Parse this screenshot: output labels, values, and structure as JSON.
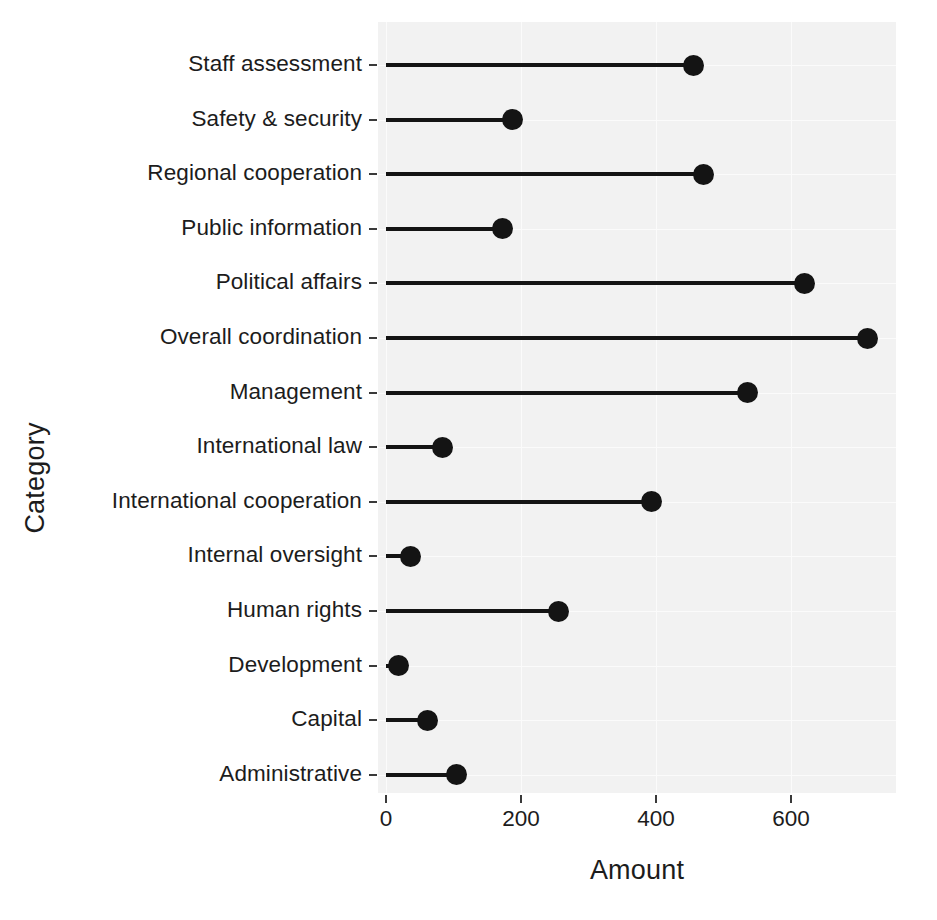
{
  "chart_data": {
    "type": "bar",
    "subtype": "lollipop-horizontal",
    "title": "",
    "xlabel": "Amount",
    "ylabel": "Category",
    "orientation": "horizontal",
    "grid": true,
    "legend": "none",
    "xlim": [
      -18,
      750
    ],
    "xticks": [
      0,
      200,
      400,
      600
    ],
    "xtick_labels": [
      "0",
      "200",
      "400",
      "600"
    ],
    "categories": [
      "Staff assessment",
      "Safety & security",
      "Regional cooperation",
      "Public information",
      "Political affairs",
      "Overall coordination",
      "Management",
      "International law",
      "International cooperation",
      "Internal oversight",
      "Human rights",
      "Development",
      "Capital",
      "Administrative"
    ],
    "values": [
      455,
      188,
      471,
      173,
      620,
      714,
      536,
      83,
      394,
      36,
      255,
      18,
      61,
      105
    ],
    "marker_color": "#141414",
    "stem_color": "#141414",
    "panel_color": "#f2f2f2",
    "grid_color": "#fbfbfb"
  }
}
